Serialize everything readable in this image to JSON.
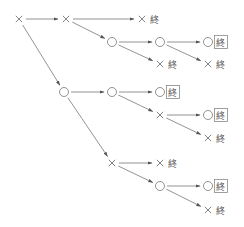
{
  "diagram": {
    "type": "tree-diagram",
    "symbols": {
      "win": "○",
      "lose": "×",
      "end": "終"
    },
    "nodes": [
      {
        "id": "A",
        "mark": "×",
        "x": 19,
        "y": 19
      },
      {
        "id": "B",
        "mark": "×",
        "x": 66,
        "y": 19
      },
      {
        "id": "C",
        "mark": "×",
        "x": 142,
        "y": 19,
        "end": "終",
        "boxed": false
      },
      {
        "id": "D",
        "mark": "○",
        "x": 112,
        "y": 42
      },
      {
        "id": "E",
        "mark": "○",
        "x": 160,
        "y": 42
      },
      {
        "id": "F",
        "mark": "○",
        "x": 208,
        "y": 42,
        "end": "終",
        "boxed": true
      },
      {
        "id": "D2",
        "mark": "×",
        "x": 160,
        "y": 64,
        "end": "終",
        "boxed": false
      },
      {
        "id": "E2",
        "mark": "×",
        "x": 208,
        "y": 64,
        "end": "終",
        "boxed": false
      },
      {
        "id": "G",
        "mark": "○",
        "x": 64,
        "y": 92
      },
      {
        "id": "H",
        "mark": "○",
        "x": 112,
        "y": 92
      },
      {
        "id": "I",
        "mark": "○",
        "x": 160,
        "y": 92,
        "end": "終",
        "boxed": true
      },
      {
        "id": "J",
        "mark": "×",
        "x": 160,
        "y": 115
      },
      {
        "id": "K",
        "mark": "○",
        "x": 208,
        "y": 115,
        "end": "終",
        "boxed": true
      },
      {
        "id": "K2",
        "mark": "×",
        "x": 208,
        "y": 138,
        "end": "終",
        "boxed": false
      },
      {
        "id": "L",
        "mark": "×",
        "x": 112,
        "y": 163
      },
      {
        "id": "L2",
        "mark": "×",
        "x": 160,
        "y": 163,
        "end": "終",
        "boxed": false
      },
      {
        "id": "M",
        "mark": "○",
        "x": 160,
        "y": 186
      },
      {
        "id": "N",
        "mark": "○",
        "x": 208,
        "y": 186,
        "end": "終",
        "boxed": true
      },
      {
        "id": "N2",
        "mark": "×",
        "x": 208,
        "y": 210,
        "end": "終",
        "boxed": false
      }
    ],
    "edges": [
      [
        "A",
        "B"
      ],
      [
        "A",
        "G"
      ],
      [
        "B",
        "C"
      ],
      [
        "B",
        "D"
      ],
      [
        "D",
        "E"
      ],
      [
        "D",
        "D2"
      ],
      [
        "E",
        "F"
      ],
      [
        "E",
        "E2"
      ],
      [
        "G",
        "H"
      ],
      [
        "G",
        "L"
      ],
      [
        "H",
        "I"
      ],
      [
        "H",
        "J"
      ],
      [
        "J",
        "K"
      ],
      [
        "J",
        "K2"
      ],
      [
        "L",
        "L2"
      ],
      [
        "L",
        "M"
      ],
      [
        "M",
        "N"
      ],
      [
        "M",
        "N2"
      ]
    ],
    "colors": {
      "line": "#777777",
      "text": "#555555",
      "box": "#888888"
    }
  }
}
